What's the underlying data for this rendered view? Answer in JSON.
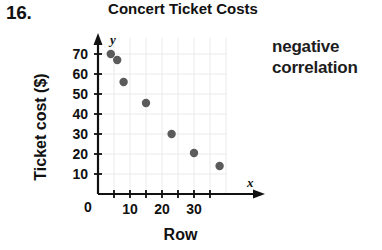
{
  "exercise": {
    "number": "16."
  },
  "annotation": {
    "line1": "negative",
    "line2": "correlation"
  },
  "chart_data": {
    "type": "scatter",
    "title": "Concert Ticket Costs",
    "xlabel": "Row",
    "ylabel": "Ticket cost ($)",
    "x_axis_variable": "x",
    "y_axis_variable": "y",
    "xlim": [
      0,
      40
    ],
    "ylim": [
      0,
      78
    ],
    "x_tick_labels": [
      "0",
      "10",
      "20",
      "30"
    ],
    "x_tick_values": [
      0,
      10,
      20,
      30
    ],
    "x_minor_tick_values": [
      5,
      15,
      25,
      35
    ],
    "y_tick_labels": [
      "10",
      "20",
      "30",
      "40",
      "50",
      "60",
      "70"
    ],
    "y_tick_values": [
      10,
      20,
      30,
      40,
      50,
      60,
      70
    ],
    "origin_label": "0",
    "grid": true,
    "legend": "none",
    "point_color": "#5b5b5b",
    "points": [
      {
        "x": 4,
        "y": 70
      },
      {
        "x": 6,
        "y": 67
      },
      {
        "x": 8,
        "y": 56
      },
      {
        "x": 15,
        "y": 45.5
      },
      {
        "x": 23,
        "y": 30
      },
      {
        "x": 30,
        "y": 20.5
      },
      {
        "x": 38,
        "y": 14
      }
    ]
  }
}
